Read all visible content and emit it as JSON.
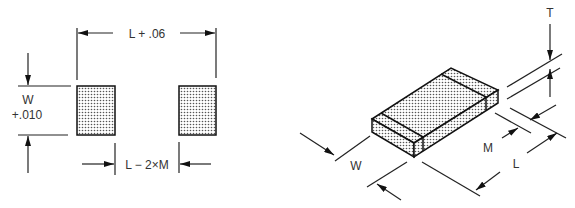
{
  "diagram": {
    "footprint": {
      "overall_length_label": "L + .06",
      "width_label_line1": "W",
      "width_label_line2": "+.010",
      "gap_label": "L − 2×M"
    },
    "component": {
      "thickness_label": "T",
      "width_label": "W",
      "terminal_label": "M",
      "length_label": "L"
    },
    "colors": {
      "line": "#222222",
      "text": "#333333",
      "pad_fill": "#dddddd",
      "background": "#ffffff"
    }
  }
}
